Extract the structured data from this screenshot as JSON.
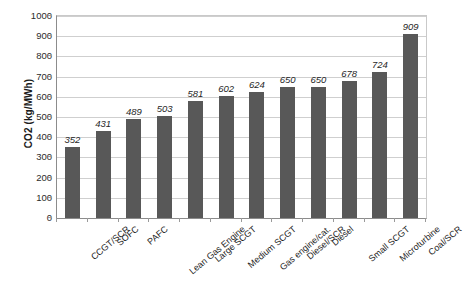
{
  "chart_data": {
    "type": "bar",
    "title": "",
    "xlabel": "",
    "ylabel": "CO2 (kg/MWh)",
    "ylim": [
      0,
      1000
    ],
    "ytick_step": 100,
    "grid": true,
    "legend": "none",
    "bar_color": "#585858",
    "gridline_color": "#cfcfcf",
    "axis_color": "#8c8c8c",
    "categories": [
      "CCGT/SCR",
      "SOFC",
      "PAFC",
      "Lean Gas Engine",
      "Large SCGT",
      "Medium SCGT",
      "Gas engine/cat.",
      "Diesel/SCR",
      "Diesel",
      "Small SCGT",
      "Microturbine",
      "Coal/SCR"
    ],
    "values": [
      352,
      431,
      489,
      503,
      581,
      602,
      624,
      650,
      650,
      678,
      724,
      909
    ],
    "yticks": [
      0,
      100,
      200,
      300,
      400,
      500,
      600,
      700,
      800,
      900,
      1000
    ],
    "ytick_labels": [
      "0",
      "100",
      "200",
      "300",
      "400",
      "500",
      "600",
      "700",
      "800",
      "900",
      "1000"
    ],
    "data_labels": [
      "352",
      "431",
      "489",
      "503",
      "581",
      "602",
      "624",
      "650",
      "650",
      "678",
      "724",
      "909"
    ]
  }
}
